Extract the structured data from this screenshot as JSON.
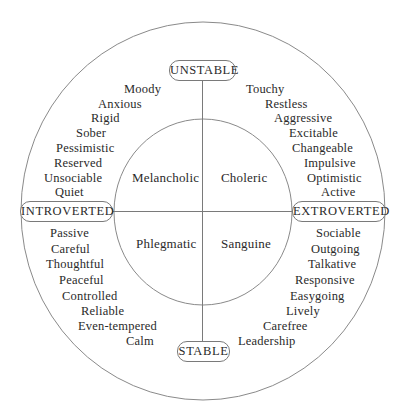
{
  "diagram": {
    "colors": {
      "line": "#8a8a8a",
      "text": "#2a2a2a",
      "background": "#ffffff"
    },
    "axes": {
      "top": "UNSTABLE",
      "bottom": "STABLE",
      "left": "INTROVERTED",
      "right": "EXTROVERTED"
    },
    "temperaments": {
      "upper_left": "Melancholic",
      "upper_right": "Choleric",
      "lower_left": "Phlegmatic",
      "lower_right": "Sanguine"
    },
    "traits": {
      "upper_left": [
        "Moody",
        "Anxious",
        "Rigid",
        "Sober",
        "Pessimistic",
        "Reserved",
        "Unsociable",
        "Quiet"
      ],
      "upper_right": [
        "Touchy",
        "Restless",
        "Aggressive",
        "Excitable",
        "Changeable",
        "Impulsive",
        "Optimistic",
        "Active"
      ],
      "lower_left": [
        "Passive",
        "Careful",
        "Thoughtful",
        "Peaceful",
        "Controlled",
        "Reliable",
        "Even-tempered",
        "Calm"
      ],
      "lower_right": [
        "Sociable",
        "Outgoing",
        "Talkative",
        "Responsive",
        "Easygoing",
        "Lively",
        "Carefree",
        "Leadership"
      ]
    }
  }
}
